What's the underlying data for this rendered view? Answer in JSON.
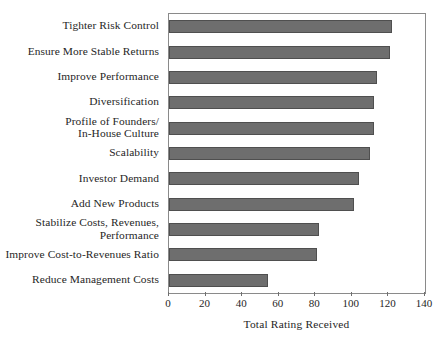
{
  "chart_data": {
    "type": "bar",
    "orientation": "horizontal",
    "title": "",
    "subtitle": "",
    "xlabel": "Total Rating Received",
    "ylabel": "",
    "xlim": [
      0,
      140
    ],
    "xticks": [
      0,
      20,
      40,
      60,
      80,
      100,
      120,
      140
    ],
    "xtick_labels": [
      "0",
      "20",
      "40",
      "60",
      "80",
      "100",
      "120",
      "140"
    ],
    "grid": false,
    "legend": false,
    "bar_color": "#6e6e6e",
    "bar_edge_color": "#4f4f4f",
    "frame_color": "#8a8a8a",
    "background": "#ffffff",
    "categories": [
      "Tighter Risk Control",
      "Ensure More Stable Returns",
      "Improve Performance",
      "Diversification",
      "Profile of Founders/\nIn-House Culture",
      "Scalability",
      "Investor Demand",
      "Add New Products",
      "Stabilize Costs, Revenues,\nPerformance",
      "Improve Cost-to-Revenues Ratio",
      "Reduce Management Costs"
    ],
    "values": [
      122,
      121,
      114,
      112,
      112,
      110,
      104,
      101,
      82,
      81,
      54
    ]
  }
}
